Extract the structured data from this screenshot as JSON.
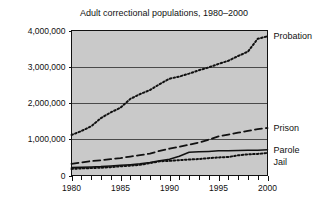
{
  "chart_data": {
    "type": "line",
    "title": "Adult correctional populations, 1980–2000",
    "xlabel": "",
    "ylabel": "",
    "xlim": [
      1980,
      2000
    ],
    "ylim": [
      0,
      4000000
    ],
    "grid": true,
    "legend_position": "right-inline-labels",
    "x_ticks": [
      1980,
      1985,
      1990,
      1995,
      2000
    ],
    "x_tick_labels": [
      "1980",
      "1985",
      "1990",
      "1995",
      "2000"
    ],
    "x_minor_tick_interval": 1,
    "y_ticks": [
      0,
      1000000,
      2000000,
      3000000,
      4000000
    ],
    "y_tick_labels": [
      "0",
      "1,000,000",
      "2,000,000",
      "3,000,000",
      "4,000,000"
    ],
    "x": [
      1980,
      1981,
      1982,
      1983,
      1984,
      1985,
      1986,
      1987,
      1988,
      1989,
      1990,
      1991,
      1992,
      1993,
      1994,
      1995,
      1996,
      1997,
      1998,
      1999,
      2000
    ],
    "series": [
      {
        "name": "Probation",
        "style": "dotted",
        "values": [
          1118000,
          1225000,
          1357000,
          1582000,
          1740000,
          1870000,
          2114000,
          2247000,
          2356000,
          2522000,
          2670000,
          2729000,
          2811000,
          2903000,
          2981000,
          3078000,
          3165000,
          3296000,
          3417000,
          3773000,
          3839000
        ]
      },
      {
        "name": "Prison",
        "style": "dashed",
        "values": [
          320000,
          360000,
          400000,
          420000,
          450000,
          480000,
          523000,
          560000,
          603000,
          680000,
          740000,
          790000,
          850000,
          910000,
          990000,
          1080000,
          1130000,
          1180000,
          1230000,
          1280000,
          1310000
        ]
      },
      {
        "name": "Parole",
        "style": "solid",
        "values": [
          220000,
          225000,
          235000,
          245000,
          265000,
          280000,
          300000,
          325000,
          360000,
          410000,
          450000,
          530000,
          640000,
          655000,
          665000,
          680000,
          685000,
          690000,
          696000,
          700000,
          712000
        ]
      },
      {
        "name": "Jail",
        "style": "dotted",
        "values": [
          182000,
          195000,
          205000,
          215000,
          230000,
          254000,
          272000,
          294000,
          341000,
          393000,
          403000,
          424000,
          441000,
          455000,
          479000,
          499000,
          510000,
          557000,
          584000,
          596000,
          621000
        ]
      }
    ]
  },
  "colors": {
    "plot_background": "#c9c9c9",
    "page_background": "#ffffff",
    "ink": "#111111",
    "gridline": "#4a4a4a"
  }
}
